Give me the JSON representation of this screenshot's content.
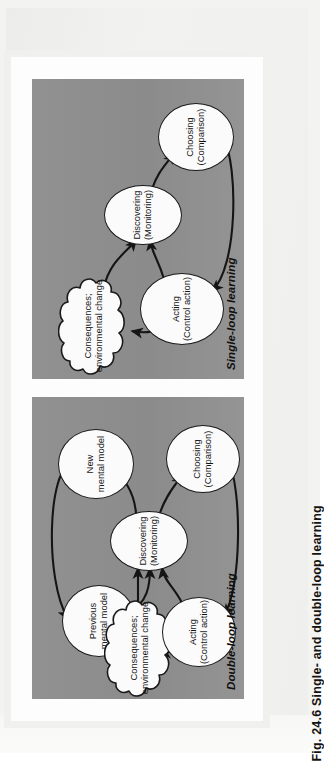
{
  "caption": {
    "label": "Fig. 24.6  Single- and double-loop learning",
    "figure_number": "Fig. 24.6",
    "figure_title": "Single- and double-loop learning"
  },
  "colors": {
    "panel_background": "#8e8e8e",
    "node_fill": "#fbfbfb",
    "node_stroke": "#1a1a1a",
    "page_background": "#f3f3f2",
    "card_background": "#fdfdfd",
    "text": "#141414"
  },
  "panels": [
    {
      "id": "double-loop",
      "title": "Double-loop learning",
      "nodes": [
        {
          "id": "previous-mental-model",
          "line1": "Previous",
          "line2": "mental model"
        },
        {
          "id": "new-mental-model",
          "line1": "New",
          "line2": "mental model"
        },
        {
          "id": "consequences",
          "line1": "Consequences;",
          "line2": "environmental change",
          "shape": "cloud"
        },
        {
          "id": "acting",
          "line1": "Acting",
          "line2": "(Control action)"
        },
        {
          "id": "discovering",
          "line1": "Discovering",
          "line2": "(Monitoring)"
        },
        {
          "id": "choosing",
          "line1": "Choosing",
          "line2": "(Comparison)"
        }
      ],
      "edges": [
        {
          "from": "new-mental-model",
          "to": "previous-mental-model"
        },
        {
          "from": "previous-mental-model",
          "to": "discovering"
        },
        {
          "from": "consequences",
          "to": "discovering"
        },
        {
          "from": "acting",
          "to": "discovering"
        },
        {
          "from": "acting",
          "to": "consequences"
        },
        {
          "from": "discovering",
          "to": "choosing"
        },
        {
          "from": "discovering",
          "to": "new-mental-model"
        },
        {
          "from": "choosing",
          "to": "acting"
        }
      ]
    },
    {
      "id": "single-loop",
      "title": "Single-loop learning",
      "nodes": [
        {
          "id": "consequences",
          "line1": "Consequences;",
          "line2": "environmental change",
          "shape": "cloud"
        },
        {
          "id": "acting",
          "line1": "Acting",
          "line2": "(Control action)"
        },
        {
          "id": "discovering",
          "line1": "Discovering",
          "line2": "(Monitoring)"
        },
        {
          "id": "choosing",
          "line1": "Choosing",
          "line2": "(Comparison)"
        }
      ],
      "edges": [
        {
          "from": "consequences",
          "to": "discovering"
        },
        {
          "from": "acting",
          "to": "discovering"
        },
        {
          "from": "acting",
          "to": "consequences"
        },
        {
          "from": "discovering",
          "to": "choosing"
        },
        {
          "from": "choosing",
          "to": "acting"
        }
      ]
    }
  ]
}
